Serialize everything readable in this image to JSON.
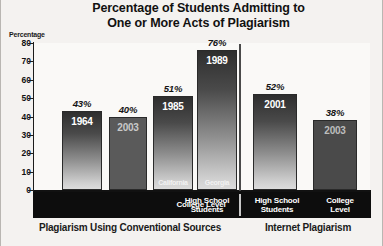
{
  "chart_data": {
    "type": "bar",
    "title": "Percentage of Students Admitting to One or More Acts of Plagiarism",
    "title_line1": "Percentage of Students Admitting to",
    "title_line2": "One or More Acts of Plagiarism",
    "ylabel": "Percentage",
    "xlabel": "",
    "ylim": [
      0,
      80
    ],
    "yticks": [
      "80",
      "70",
      "60",
      "50",
      "40",
      "30",
      "20",
      "10",
      "0"
    ],
    "grid": false,
    "legend": "none",
    "categories": [
      "College Level",
      "High School Students",
      "High School Students",
      "College Level"
    ],
    "bars": [
      {
        "value": 43,
        "value_label": "43%",
        "year": "1964",
        "region": "",
        "category": "College Level",
        "group": "Plagiarism Using Conventional Sources",
        "fill": "gradient"
      },
      {
        "value": 40,
        "value_label": "40%",
        "year": "2003",
        "region": "",
        "category": "College Level",
        "group": "Plagiarism Using Conventional Sources",
        "fill": "solid-mid"
      },
      {
        "value": 51,
        "value_label": "51%",
        "year": "1985",
        "region": "California",
        "category": "High School Students",
        "group": "Plagiarism Using Conventional Sources",
        "fill": "gradient"
      },
      {
        "value": 76,
        "value_label": "76%",
        "year": "1989",
        "region": "Georgia",
        "category": "High School Students",
        "group": "Plagiarism Using Conventional Sources",
        "fill": "gradient"
      },
      {
        "value": 52,
        "value_label": "52%",
        "year": "2001",
        "region": "",
        "category": "High School Students",
        "group": "Internet Plagiarism",
        "fill": "gradient"
      },
      {
        "value": 38,
        "value_label": "38%",
        "year": "2003",
        "region": "",
        "category": "College Level",
        "group": "Internet Plagiarism",
        "fill": "solid-dark"
      }
    ],
    "groups": [
      {
        "label": "Plagiarism Using Conventional Sources"
      },
      {
        "label": "Internet Plagiarism"
      }
    ],
    "category_band": [
      {
        "label": "College Level"
      },
      {
        "label": "High School Students"
      },
      {
        "label": "High School\nStudents"
      },
      {
        "label": "College\nLevel"
      }
    ],
    "colors": {
      "background": "#f4f2f0",
      "plot_background": "#faf9f7",
      "axis": "#111111",
      "band": "#0d0d0d",
      "band_text": "#ffffff",
      "bar_dark": "#3c3c3c",
      "bar_light": "#d5d5d5",
      "bar_solid_mid": "#5a5a5a",
      "bar_solid_dark": "#4a4a4a"
    }
  }
}
